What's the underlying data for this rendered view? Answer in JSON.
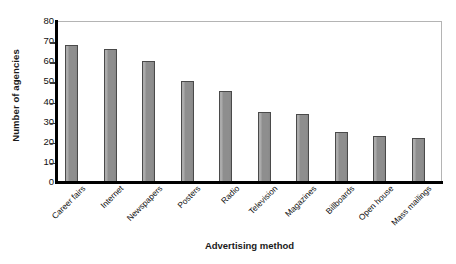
{
  "chart_data": {
    "type": "bar",
    "title": "",
    "xlabel": "Advertising method",
    "ylabel": "Number of agencies",
    "categories": [
      "Career fairs",
      "Internet",
      "Newspapers",
      "Posters",
      "Radio",
      "Television",
      "Magazines",
      "Billboards",
      "Open house",
      "Mass mailings"
    ],
    "values": [
      68,
      66,
      60,
      50,
      45,
      35,
      34,
      25,
      23,
      22
    ],
    "ylim": [
      0,
      80
    ],
    "yticks": [
      80,
      70,
      60,
      50,
      40,
      30,
      20,
      10,
      0
    ],
    "grid": false,
    "legend": null,
    "bar_color": "#8e8e8e",
    "bar_edge_color": "#4a4a4a",
    "axis_color": "#000000",
    "frame_color": "#b4b4b4",
    "background": "#ffffff"
  }
}
